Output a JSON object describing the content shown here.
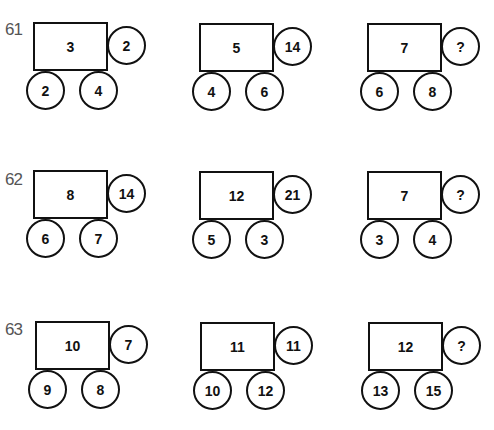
{
  "puzzles": [
    {
      "number": "61",
      "items": [
        {
          "box": "3",
          "right": "2",
          "bottom_left": "2",
          "bottom_right": "4"
        },
        {
          "box": "5",
          "right": "14",
          "bottom_left": "4",
          "bottom_right": "6"
        },
        {
          "box": "7",
          "right": "?",
          "bottom_left": "6",
          "bottom_right": "8"
        }
      ]
    },
    {
      "number": "62",
      "items": [
        {
          "box": "8",
          "right": "14",
          "bottom_left": "6",
          "bottom_right": "7"
        },
        {
          "box": "12",
          "right": "21",
          "bottom_left": "5",
          "bottom_right": "3"
        },
        {
          "box": "7",
          "right": "?",
          "bottom_left": "3",
          "bottom_right": "4"
        }
      ]
    },
    {
      "number": "63",
      "items": [
        {
          "box": "10",
          "right": "7",
          "bottom_left": "9",
          "bottom_right": "8"
        },
        {
          "box": "11",
          "right": "11",
          "bottom_left": "10",
          "bottom_right": "12"
        },
        {
          "box": "12",
          "right": "?",
          "bottom_left": "13",
          "bottom_right": "15"
        }
      ]
    }
  ]
}
